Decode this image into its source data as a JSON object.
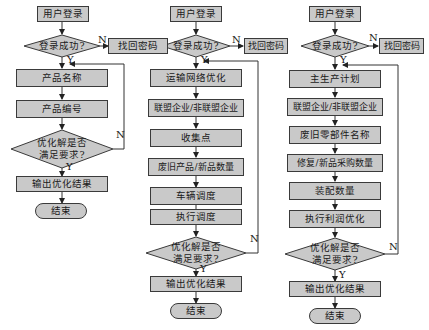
{
  "flowcharts": [
    {
      "name": "flowchart-1",
      "start": "用户登录",
      "login_check": "登录成功?",
      "recover": "找回密码",
      "steps": [
        "产品名称",
        "产品编号"
      ],
      "decision": [
        "优化解是否",
        "满足要求?"
      ],
      "output": "输出优化结果",
      "end": "结束"
    },
    {
      "name": "flowchart-2",
      "start": "用户登录",
      "login_check": "登录成功?",
      "recover": "找回密码",
      "steps": [
        "运输网络优化",
        "联盟企业/非联盟企业",
        "收集点",
        "废旧产品/新品数量",
        "车辆调度",
        "执行调度"
      ],
      "decision": [
        "优化解是否",
        "满足要求?"
      ],
      "output": "输出优化结果",
      "end": "结束"
    },
    {
      "name": "flowchart-3",
      "start": "用户登录",
      "login_check": "登录成功?",
      "recover": "找回密码",
      "steps": [
        "主生产计划",
        "联盟企业/非联盟企业",
        "废旧零部件名称",
        "修复/新品采购数量",
        "装配数量",
        "执行利润优化"
      ],
      "decision": [
        "优化解是否",
        "满足要求?"
      ],
      "output": "输出优化结果",
      "end": "结束"
    }
  ],
  "labels": {
    "yes": "Y",
    "no": "N"
  },
  "colors": {
    "fill": "#c9c9c9",
    "stroke": "#3a3a3a",
    "background": "#ffffff"
  }
}
